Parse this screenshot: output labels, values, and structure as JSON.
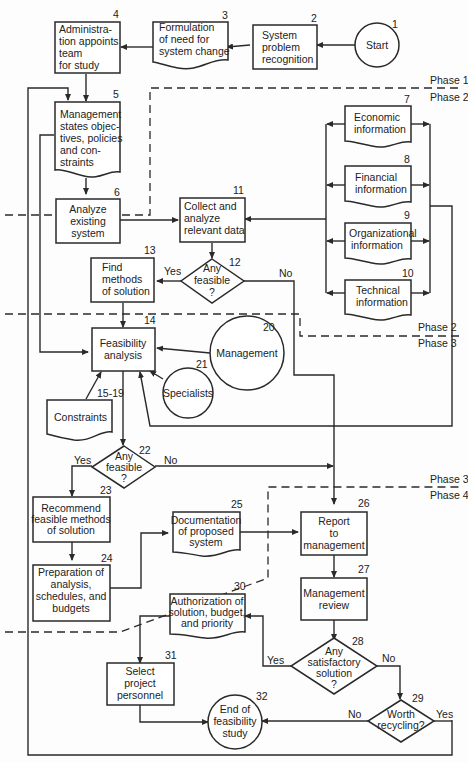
{
  "diagram": {
    "phases": [
      {
        "upper": "Phase 1",
        "lower": "Phase 2"
      },
      {
        "upper": "Phase 2",
        "lower": "Phase 3"
      },
      {
        "upper": "Phase 3",
        "lower": "Phase 4"
      }
    ],
    "nodes": {
      "n1": {
        "num": "1",
        "lines": [
          "Start"
        ],
        "shape": "circle"
      },
      "n2": {
        "num": "2",
        "lines": [
          "System",
          "problem",
          "recognition"
        ],
        "shape": "process"
      },
      "n3": {
        "num": "3",
        "lines": [
          "Formulation",
          "of need for",
          "system change"
        ],
        "shape": "document"
      },
      "n4": {
        "num": "4",
        "lines": [
          "Administra-",
          "tion appoints",
          "team",
          "for study"
        ],
        "shape": "process"
      },
      "n5": {
        "num": "5",
        "lines": [
          "Management",
          "states objec-",
          "tives, policies",
          "and con-",
          "straints"
        ],
        "shape": "document"
      },
      "n6": {
        "num": "6",
        "lines": [
          "Analyze",
          "existing",
          "system"
        ],
        "shape": "process"
      },
      "n7": {
        "num": "7",
        "lines": [
          "Economic",
          "information"
        ],
        "shape": "document"
      },
      "n8": {
        "num": "8",
        "lines": [
          "Financial",
          "information"
        ],
        "shape": "document"
      },
      "n9": {
        "num": "9",
        "lines": [
          "Organizational",
          "information"
        ],
        "shape": "document"
      },
      "n10": {
        "num": "10",
        "lines": [
          "Technical",
          "information"
        ],
        "shape": "document"
      },
      "n11": {
        "num": "11",
        "lines": [
          "Collect and",
          "analyze",
          "relevant data"
        ],
        "shape": "process"
      },
      "n12": {
        "num": "12",
        "lines": [
          "Any",
          "feasible",
          "?"
        ],
        "shape": "decision"
      },
      "n13": {
        "num": "13",
        "lines": [
          "Find",
          "methods",
          "of solution"
        ],
        "shape": "process"
      },
      "n14": {
        "num": "14",
        "lines": [
          "Feasibility",
          "analysis"
        ],
        "shape": "process"
      },
      "n15": {
        "num": "15-19",
        "lines": [
          "Constraints"
        ],
        "shape": "document"
      },
      "n20": {
        "num": "20",
        "lines": [
          "Management"
        ],
        "shape": "circle"
      },
      "n21": {
        "num": "21",
        "lines": [
          "Specialists"
        ],
        "shape": "circle"
      },
      "n22": {
        "num": "22",
        "lines": [
          "Any",
          "feasible",
          "?"
        ],
        "shape": "decision"
      },
      "n23": {
        "num": "23",
        "lines": [
          "Recommend",
          "feasible methods",
          "of solution"
        ],
        "shape": "process"
      },
      "n24": {
        "num": "24",
        "lines": [
          "Preparation of",
          "analysis,",
          "schedules, and",
          "budgets"
        ],
        "shape": "process"
      },
      "n25": {
        "num": "25",
        "lines": [
          "Documentation",
          "of proposed",
          "system"
        ],
        "shape": "document"
      },
      "n26": {
        "num": "26",
        "lines": [
          "Report",
          "to",
          "management"
        ],
        "shape": "process"
      },
      "n27": {
        "num": "27",
        "lines": [
          "Management",
          "review"
        ],
        "shape": "process"
      },
      "n28": {
        "num": "28",
        "lines": [
          "Any",
          "satisfactory",
          "solution",
          "?"
        ],
        "shape": "decision"
      },
      "n29": {
        "num": "29",
        "lines": [
          "Worth",
          "recycling?"
        ],
        "shape": "decision"
      },
      "n30": {
        "num": "30",
        "lines": [
          "Authorization of",
          "solution, budget,",
          "and priority"
        ],
        "shape": "document"
      },
      "n31": {
        "num": "31",
        "lines": [
          "Select",
          "project",
          "personnel"
        ],
        "shape": "process"
      },
      "n32": {
        "num": "32",
        "lines": [
          "End of",
          "feasibility",
          "study"
        ],
        "shape": "circle"
      }
    },
    "edge_labels": {
      "n12_yes": "Yes",
      "n12_no": "No",
      "n22_yes": "Yes",
      "n22_no": "No",
      "n28_yes": "Yes",
      "n28_no": "No",
      "n29_no": "No",
      "n29_yes": "Yes"
    }
  }
}
